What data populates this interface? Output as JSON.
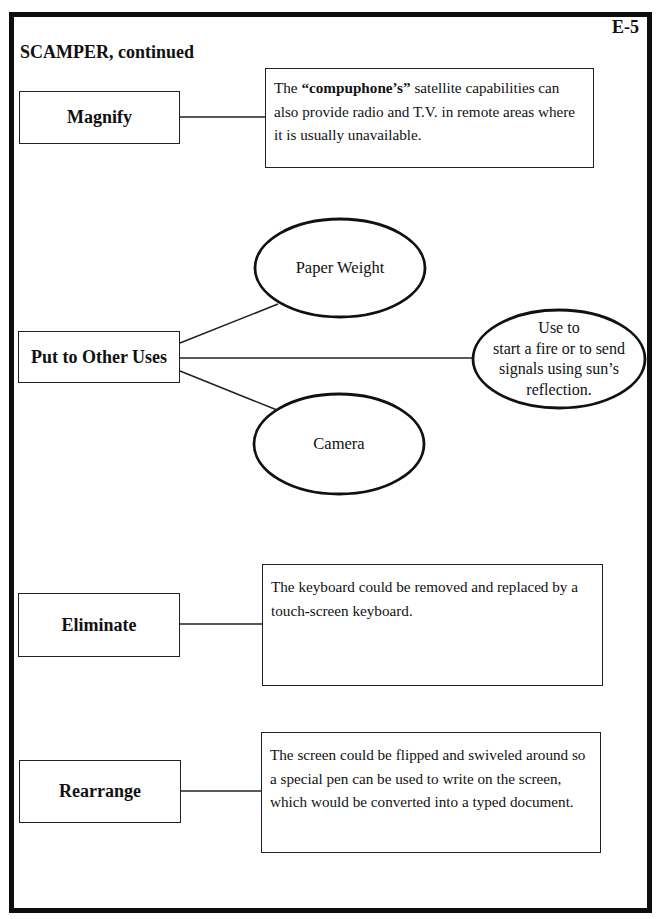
{
  "page": {
    "id": "E-5",
    "title": "SCAMPER, continued"
  },
  "sections": {
    "magnify": {
      "label": "Magnify",
      "description_prefix": "The ",
      "description_bold": "“compuphone’s”",
      "description_suffix": " satellite capabilities can also provide radio and T.V. in remote areas where it is usually unavailable."
    },
    "put_to_other_uses": {
      "label": "Put to Other Uses",
      "uses": [
        {
          "text": "Paper Weight"
        },
        {
          "text": "Use to start a fire or to send signals using sun’s reflection.",
          "lines": [
            "Use to",
            "start a fire or to send",
            "signals using sun’s",
            "reflection."
          ]
        },
        {
          "text": "Camera"
        }
      ]
    },
    "eliminate": {
      "label": "Eliminate",
      "description": "The keyboard could be removed and replaced by a touch-screen keyboard."
    },
    "rearrange": {
      "label": "Rearrange",
      "description": "The screen could be flipped and swiveled around so a special pen can be used to write on the screen, which would be converted into a typed document."
    }
  },
  "colors": {
    "line": "#222222",
    "frame": "#0d0d0d",
    "background": "#ffffff"
  }
}
